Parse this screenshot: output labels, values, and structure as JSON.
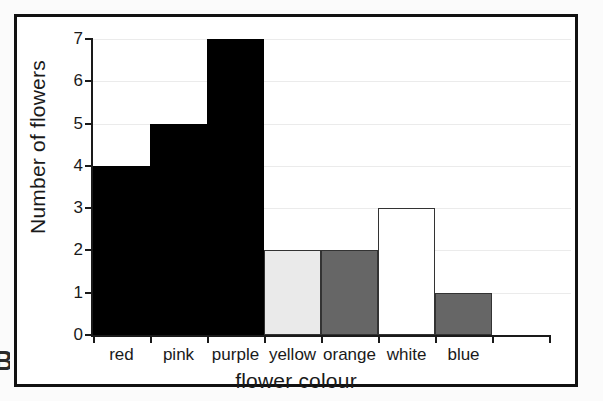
{
  "page": {
    "corner_marker": "B",
    "background": "#fbfbfb",
    "frame_color": "#111111"
  },
  "chart_data": {
    "type": "bar",
    "title": "",
    "subtitle": "",
    "xlabel": "flower colour",
    "ylabel": "Number of flowers",
    "categories": [
      "red",
      "pink",
      "purple",
      "yellow",
      "orange",
      "white",
      "blue"
    ],
    "values": [
      4,
      5,
      7,
      2,
      2,
      3,
      1
    ],
    "series": [
      {
        "name": "Number of flowers",
        "values": [
          4,
          5,
          7,
          2,
          2,
          3,
          1
        ]
      }
    ],
    "bar_colors": [
      "#000000",
      "#000000",
      "#000000",
      "#eaeaea",
      "#666666",
      "#ffffff",
      "#666666"
    ],
    "bar_border_colors": [
      "#000000",
      "#000000",
      "#000000",
      "#333333",
      "#333333",
      "#333333",
      "#333333"
    ],
    "ylim": [
      0,
      7
    ],
    "yticks": [
      0,
      1,
      2,
      3,
      4,
      5,
      6,
      7
    ],
    "ytick_labels": [
      "0",
      "1",
      "2",
      "3",
      "4",
      "5",
      "6",
      "7"
    ],
    "grid": true,
    "grid_color": "#ebebeb",
    "legend": false,
    "legend_position": "none",
    "bar_gap": 0,
    "axis_color": "#1a1a1a"
  }
}
